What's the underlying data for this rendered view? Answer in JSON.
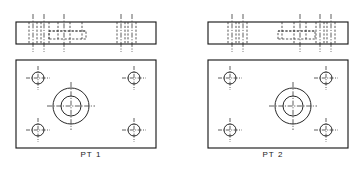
{
  "drawing": {
    "type": "mechanical-orthographic-drawing",
    "description": "Two mounting plates shown as edge (section) view above and plan view below",
    "background_color": "#ffffff",
    "line_color": "#1c1c1c",
    "hidden_line_color": "#3a3a3a",
    "center_line_color": "#2a2a2a"
  },
  "parts": [
    {
      "id": "pt-1",
      "caption": "PT 1",
      "counterbore_side": "left",
      "elevation": {
        "name": "edge-view",
        "x": 16,
        "y": 22,
        "width": 140,
        "height": 22,
        "center_lines_x": [
          33,
          44,
          64,
          121,
          132
        ],
        "hidden_vertical_x": [
          29,
          34,
          41,
          46,
          58,
          70,
          82
        ],
        "hidden_counterbore": {
          "x1": 46,
          "x2": 86,
          "y_top": 31,
          "y_bottom": 39
        }
      },
      "plan": {
        "name": "plan-view",
        "x": 16,
        "y": 60,
        "width": 140,
        "height": 88,
        "bolt_holes": [
          {
            "cx": 38,
            "cy": 78,
            "r": 6
          },
          {
            "cx": 134,
            "cy": 78,
            "r": 6
          },
          {
            "cx": 38,
            "cy": 130,
            "r": 6
          },
          {
            "cx": 134,
            "cy": 130,
            "r": 6
          }
        ],
        "counterbore": {
          "cx": 71,
          "cy": 106,
          "r_outer": 18,
          "r_inner": 10
        }
      }
    },
    {
      "id": "pt-2",
      "caption": "PT 2",
      "counterbore_side": "right",
      "elevation": {
        "name": "edge-view",
        "x": 26,
        "y": 22,
        "width": 140,
        "height": 22,
        "center_lines_x": [
          50,
          61,
          118,
          138,
          149
        ],
        "hidden_vertical_x": [
          100,
          112,
          124,
          136,
          141,
          148,
          153
        ],
        "hidden_counterbore": {
          "x1": 96,
          "x2": 136,
          "y_top": 31,
          "y_bottom": 39
        }
      },
      "plan": {
        "name": "plan-view",
        "x": 26,
        "y": 60,
        "width": 140,
        "height": 88,
        "bolt_holes": [
          {
            "cx": 48,
            "cy": 78,
            "r": 6
          },
          {
            "cx": 144,
            "cy": 78,
            "r": 6
          },
          {
            "cx": 48,
            "cy": 130,
            "r": 6
          },
          {
            "cx": 144,
            "cy": 130,
            "r": 6
          }
        ],
        "counterbore": {
          "cx": 111,
          "cy": 106,
          "r_outer": 18,
          "r_inner": 10
        }
      }
    }
  ]
}
